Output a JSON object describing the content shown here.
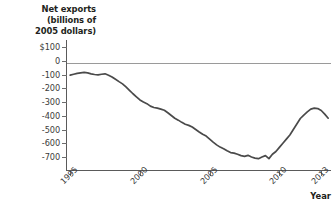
{
  "chart_data": {
    "type": "line",
    "title": "Net exports (billions of 2005 dollars)",
    "ylabel": "Net exports (billions of 2005 dollars)",
    "xlabel": "Year",
    "grid": false,
    "legend": "none",
    "xlim": [
      1994.7,
      2013.7
    ],
    "ylim": [
      -760,
      130
    ],
    "yticks": [
      100,
      0,
      -100,
      -200,
      -300,
      -400,
      -500,
      -600,
      -700
    ],
    "ytick_labels": [
      "$100",
      "0",
      "-100",
      "-200",
      "-300",
      "-400",
      "-500",
      "-600",
      "-700"
    ],
    "xticks": [
      1995,
      2000,
      2005,
      2010,
      2013
    ],
    "xtick_labels": [
      "1995",
      "2000",
      "2005",
      "2010",
      "2013"
    ],
    "zero_reference_line": 0,
    "series": [
      {
        "name": "Net exports",
        "color": "#4a4a4a",
        "x": [
          1995.0,
          1995.25,
          1995.5,
          1995.75,
          1996.0,
          1996.25,
          1996.5,
          1996.75,
          1997.0,
          1997.25,
          1997.5,
          1997.75,
          1998.0,
          1998.25,
          1998.5,
          1998.75,
          1999.0,
          1999.25,
          1999.5,
          1999.75,
          2000.0,
          2000.25,
          2000.5,
          2000.75,
          2001.0,
          2001.25,
          2001.5,
          2001.75,
          2002.0,
          2002.25,
          2002.5,
          2002.75,
          2003.0,
          2003.25,
          2003.5,
          2003.75,
          2004.0,
          2004.25,
          2004.5,
          2004.75,
          2005.0,
          2005.25,
          2005.5,
          2005.75,
          2006.0,
          2006.25,
          2006.5,
          2006.75,
          2007.0,
          2007.25,
          2007.5,
          2007.75,
          2008.0,
          2008.25,
          2008.5,
          2008.75,
          2009.0,
          2009.25,
          2009.5,
          2009.75,
          2010.0,
          2010.25,
          2010.5,
          2010.75,
          2011.0,
          2011.25,
          2011.5,
          2011.75,
          2012.0,
          2012.25,
          2012.5,
          2012.75,
          2013.0,
          2013.25,
          2013.5
        ],
        "values": [
          -105,
          -98,
          -92,
          -88,
          -85,
          -88,
          -95,
          -100,
          -103,
          -98,
          -95,
          -105,
          -118,
          -135,
          -152,
          -168,
          -190,
          -215,
          -240,
          -262,
          -285,
          -300,
          -312,
          -330,
          -340,
          -345,
          -352,
          -360,
          -378,
          -398,
          -418,
          -432,
          -448,
          -462,
          -470,
          -482,
          -500,
          -518,
          -535,
          -548,
          -570,
          -592,
          -612,
          -628,
          -640,
          -655,
          -668,
          -672,
          -680,
          -690,
          -695,
          -688,
          -700,
          -708,
          -712,
          -700,
          -690,
          -712,
          -680,
          -660,
          -630,
          -600,
          -570,
          -540,
          -500,
          -460,
          -420,
          -395,
          -372,
          -352,
          -345,
          -348,
          -362,
          -388,
          -418
        ],
        "recovery_points_x": [
          2009.5,
          2009.75,
          2010.0,
          2010.25,
          2010.5,
          2010.75,
          2011.0,
          2011.25,
          2011.5,
          2011.75,
          2012.0,
          2012.25,
          2012.5,
          2012.75,
          2013.0,
          2013.25,
          2013.5
        ],
        "note": "Series declines from about -100 in 1995 to a trough near -710 in 2006, then recovers sharply to about -345 by 2009, dips to near -430 in 2011, and rises to about -330 by 2013."
      }
    ]
  },
  "axis": {
    "y_title_lines": [
      "Net exports",
      "(billions of",
      "2005 dollars)"
    ],
    "x_title": "Year"
  }
}
